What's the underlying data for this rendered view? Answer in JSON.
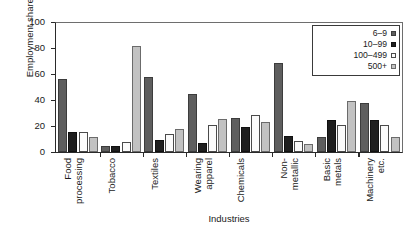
{
  "chart_data": {
    "type": "bar",
    "title": "",
    "xlabel": "Industries",
    "ylabel": "Employment share (%)",
    "ylim": [
      0,
      100
    ],
    "yticks": [
      0,
      20,
      40,
      60,
      80,
      100
    ],
    "ytick_labels": [
      "0",
      "20",
      "40",
      "60",
      "80",
      "100"
    ],
    "grid": false,
    "legend_position": "top-right",
    "categories": [
      "Food processing",
      "Tobacco",
      "Textiles",
      "Wearing apparel",
      "Chemicals",
      "Non-metallic",
      "Basic metals",
      "Machinery etc."
    ],
    "category_lines": [
      [
        "Food",
        "processing"
      ],
      [
        "Tobacco"
      ],
      [
        "Textiles"
      ],
      [
        "Wearing",
        "apparel"
      ],
      [
        "Chemicals"
      ],
      [
        "Non-",
        "metallic"
      ],
      [
        "Basic",
        "metals"
      ],
      [
        "Machinery",
        "etc."
      ]
    ],
    "series": [
      {
        "name": "6–9",
        "color": "#5e5e5e",
        "values": [
          55.8,
          4.2,
          57.5,
          44.6,
          26.2,
          68.7,
          11.0,
          37.3
        ]
      },
      {
        "name": "10–99",
        "color": "#1f1f1f",
        "values": [
          15.1,
          4.3,
          9.0,
          6.4,
          19.3,
          12.2,
          24.6,
          24.5
        ]
      },
      {
        "name": "100–499",
        "color": "#fbfbfb",
        "values": [
          14.8,
          7.6,
          13.6,
          20.7,
          28.2,
          8.3,
          20.7,
          20.6
        ]
      },
      {
        "name": "500+",
        "color": "#c2c2c2",
        "values": [
          11.5,
          81.8,
          17.8,
          25.3,
          22.5,
          6.2,
          39.2,
          11.4
        ]
      }
    ]
  }
}
